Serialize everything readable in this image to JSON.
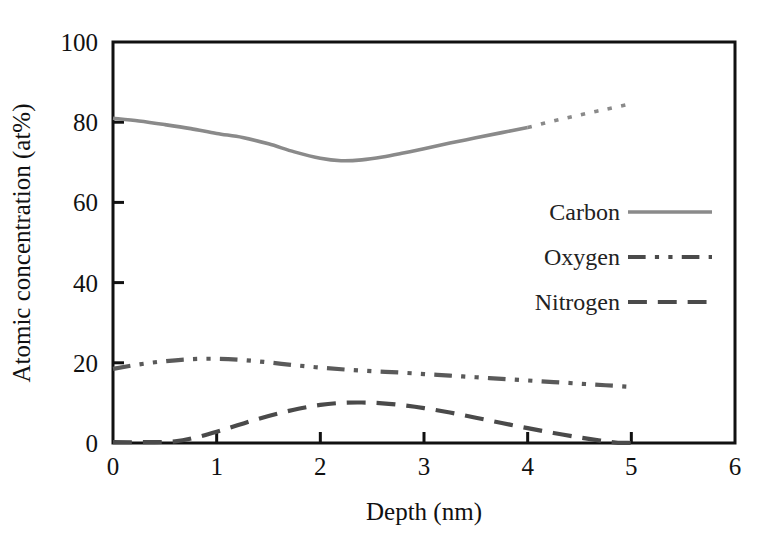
{
  "chart_data": {
    "type": "line",
    "title": "",
    "xlabel": "Depth (nm)",
    "ylabel": "Atomic concentration (at%)",
    "xlim": [
      0,
      6
    ],
    "ylim": [
      0,
      100
    ],
    "xticks": [
      0,
      1,
      2,
      3,
      4,
      5,
      6
    ],
    "xtick_labels": [
      "0",
      "1",
      "2",
      "3",
      "4",
      "5",
      "6"
    ],
    "yticks": [
      0,
      20,
      40,
      60,
      80,
      100
    ],
    "ytick_labels": [
      "0",
      "20",
      "40",
      "60",
      "80",
      "100"
    ],
    "grid": false,
    "legend_position": "center-right-inside",
    "series": [
      {
        "name": "Carbon",
        "style": "solid",
        "color": "#8a8a8a",
        "x": [
          0.0,
          0.25,
          0.5,
          0.75,
          1.0,
          1.25,
          1.5,
          1.75,
          2.0,
          2.2,
          2.4,
          2.6,
          2.8,
          3.0,
          3.25,
          3.5,
          3.75,
          4.0
        ],
        "y": [
          81.0,
          80.3,
          79.4,
          78.4,
          77.2,
          76.2,
          74.6,
          72.6,
          71.0,
          70.4,
          70.6,
          71.3,
          72.3,
          73.4,
          74.8,
          76.1,
          77.4,
          78.7
        ]
      },
      {
        "name": "Carbon (extrapolated)",
        "style": "dotted",
        "color": "#8a8a8a",
        "parent": "Carbon",
        "x": [
          4.0,
          4.25,
          4.5,
          4.75,
          5.0
        ],
        "y": [
          78.7,
          80.3,
          81.8,
          83.2,
          84.6
        ]
      },
      {
        "name": "Oxygen",
        "style": "dash-dot-dot",
        "color": "#5a5a5a",
        "x": [
          0.0,
          0.25,
          0.5,
          0.75,
          1.0,
          1.25,
          1.5,
          1.75,
          2.0,
          2.25,
          2.5,
          2.75,
          3.0,
          3.25,
          3.5,
          3.75,
          4.0,
          4.25,
          4.5,
          4.75,
          5.0
        ],
        "y": [
          18.5,
          19.6,
          20.4,
          20.9,
          21.0,
          20.7,
          20.1,
          19.4,
          18.8,
          18.3,
          17.9,
          17.6,
          17.2,
          16.8,
          16.4,
          16.0,
          15.6,
          15.2,
          14.8,
          14.4,
          14.0
        ]
      },
      {
        "name": "Nitrogen",
        "style": "dashed",
        "color": "#4a4a4a",
        "x": [
          0.0,
          0.3,
          0.6,
          0.8,
          1.0,
          1.2,
          1.4,
          1.6,
          1.8,
          2.0,
          2.2,
          2.4,
          2.6,
          2.8,
          3.0,
          3.25,
          3.5,
          3.75,
          4.0,
          4.25,
          4.5,
          4.7,
          4.85,
          5.0
        ],
        "y": [
          0.2,
          0.2,
          0.4,
          1.4,
          2.8,
          4.4,
          6.0,
          7.4,
          8.6,
          9.5,
          10.0,
          10.1,
          9.9,
          9.4,
          8.7,
          7.6,
          6.3,
          5.0,
          3.7,
          2.5,
          1.4,
          0.6,
          0.1,
          0.0
        ]
      }
    ],
    "legend": [
      {
        "label": "Carbon",
        "style": "solid",
        "color": "#8a8a8a"
      },
      {
        "label": "Oxygen",
        "style": "dash-dot-dot",
        "color": "#4a4a4a"
      },
      {
        "label": "Nitrogen",
        "style": "dashed",
        "color": "#4a4a4a"
      }
    ]
  }
}
